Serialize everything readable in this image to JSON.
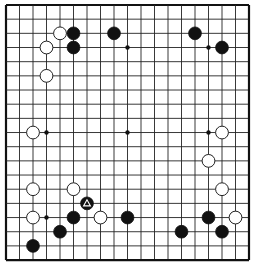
{
  "board": {
    "size": 19,
    "origin_x": 6,
    "origin_y": 5,
    "spacing_x": 13.5,
    "spacing_y": 14.17,
    "line_color": "#222222",
    "frame_color": "#111111",
    "background": "#ffffff",
    "hoshi": [
      [
        3,
        3
      ],
      [
        9,
        3
      ],
      [
        15,
        3
      ],
      [
        3,
        9
      ],
      [
        9,
        9
      ],
      [
        15,
        9
      ],
      [
        3,
        15
      ],
      [
        9,
        15
      ],
      [
        15,
        15
      ]
    ],
    "stones": [
      {
        "color": "white",
        "col": 4,
        "row": 2
      },
      {
        "color": "black",
        "col": 5,
        "row": 2
      },
      {
        "color": "black",
        "col": 8,
        "row": 2
      },
      {
        "color": "black",
        "col": 14,
        "row": 2
      },
      {
        "color": "white",
        "col": 3,
        "row": 3
      },
      {
        "color": "black",
        "col": 5,
        "row": 3
      },
      {
        "color": "black",
        "col": 16,
        "row": 3
      },
      {
        "color": "white",
        "col": 3,
        "row": 5
      },
      {
        "color": "white",
        "col": 2,
        "row": 9
      },
      {
        "color": "white",
        "col": 16,
        "row": 9
      },
      {
        "color": "white",
        "col": 15,
        "row": 11
      },
      {
        "color": "white",
        "col": 2,
        "row": 13
      },
      {
        "color": "white",
        "col": 5,
        "row": 13
      },
      {
        "color": "white",
        "col": 16,
        "row": 13
      },
      {
        "color": "black",
        "col": 6,
        "row": 14,
        "marker": "triangle"
      },
      {
        "color": "white",
        "col": 2,
        "row": 15
      },
      {
        "color": "black",
        "col": 5,
        "row": 15
      },
      {
        "color": "white",
        "col": 7,
        "row": 15
      },
      {
        "color": "black",
        "col": 9,
        "row": 15
      },
      {
        "color": "black",
        "col": 15,
        "row": 15
      },
      {
        "color": "white",
        "col": 17,
        "row": 15
      },
      {
        "color": "black",
        "col": 4,
        "row": 16
      },
      {
        "color": "black",
        "col": 13,
        "row": 16
      },
      {
        "color": "black",
        "col": 16,
        "row": 16
      },
      {
        "color": "black",
        "col": 2,
        "row": 17
      }
    ]
  }
}
